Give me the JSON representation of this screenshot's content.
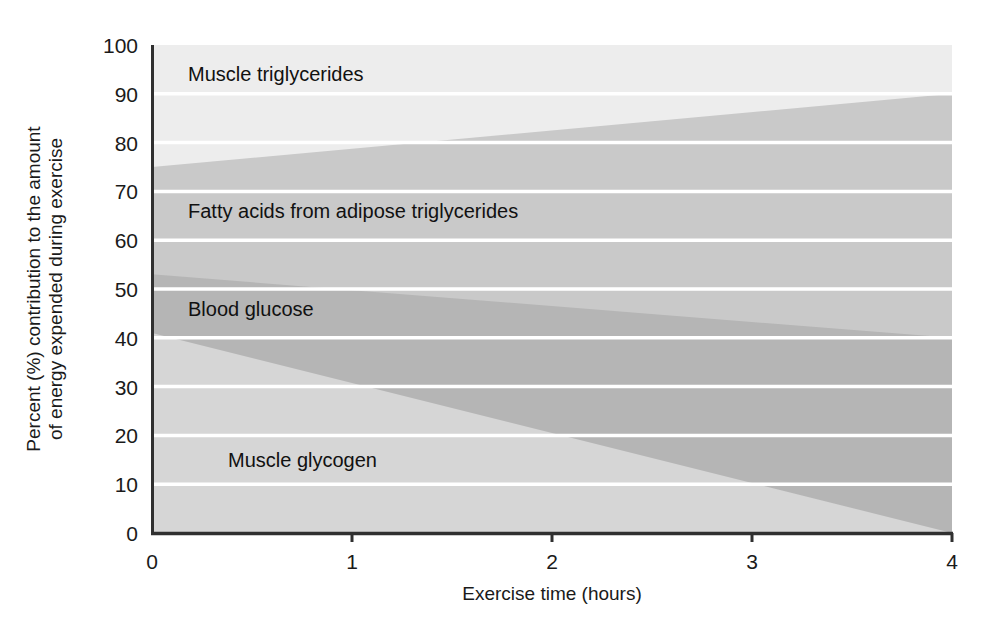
{
  "chart_data": {
    "type": "area",
    "title": "",
    "subtitle": "",
    "xlabel": "Exercise time (hours)",
    "ylabel": "Percent (%) contribution to the amount of energy expended during exercise",
    "ylabel_line1": "Percent (%) contribution to the amount",
    "ylabel_line2": "of energy expended during exercise",
    "xlim": [
      0,
      4
    ],
    "ylim": [
      0,
      100
    ],
    "x": [
      0,
      4
    ],
    "xticks": [
      0,
      1,
      2,
      3,
      4
    ],
    "xtick_labels": [
      "0",
      "1",
      "2",
      "3",
      "4"
    ],
    "yticks": [
      0,
      10,
      20,
      30,
      40,
      50,
      60,
      70,
      80,
      90,
      100
    ],
    "ytick_labels": [
      "0",
      "10",
      "20",
      "30",
      "40",
      "50",
      "60",
      "70",
      "80",
      "90",
      "100"
    ],
    "grid": true,
    "grid_color": "#ffffff",
    "legend": "inline-labels",
    "stacked": true,
    "series": [
      {
        "name": "Muscle glycogen",
        "order": 1,
        "color": "#d6d6d6",
        "values": [
          41,
          0
        ],
        "cumulative_top": [
          41,
          0
        ],
        "label_x": 0.38,
        "label_y": 15
      },
      {
        "name": "Blood glucose",
        "order": 2,
        "color": "#b5b5b5",
        "values": [
          12,
          40
        ],
        "cumulative_top": [
          53,
          40
        ],
        "label_x": 0.18,
        "label_y": 46
      },
      {
        "name": "Fatty acids from adipose triglycerides",
        "order": 3,
        "color": "#c9c9c9",
        "values": [
          22,
          50
        ],
        "cumulative_top": [
          75,
          90
        ],
        "label_x": 0.18,
        "label_y": 66
      },
      {
        "name": "Muscle triglycerides",
        "order": 4,
        "color": "#ededed",
        "values": [
          25,
          10
        ],
        "cumulative_top": [
          100,
          100
        ],
        "label_x": 0.18,
        "label_y": 94
      }
    ],
    "annotations": [],
    "axis_color": "#303030"
  }
}
